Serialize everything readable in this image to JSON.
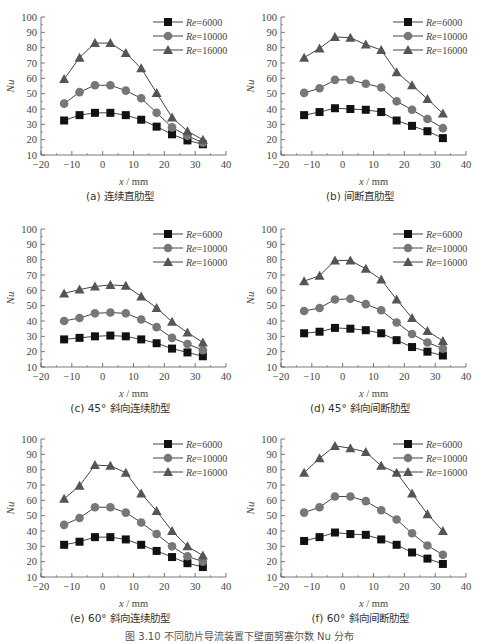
{
  "figure_caption": "图 3.10  不同肋片导流装置下壁面努塞尔数 Nu 分布",
  "chart_data": [
    {
      "type": "line",
      "caption": "(a) 连续直肋型",
      "xlabel": "x / mm",
      "ylabel": "Nu",
      "xlim": [
        -20,
        40
      ],
      "ylim": [
        10,
        100
      ],
      "xticks": [
        -20,
        -10,
        0,
        10,
        20,
        30,
        40
      ],
      "yticks": [
        10,
        20,
        30,
        40,
        50,
        60,
        70,
        80,
        90,
        100
      ],
      "grid": false,
      "legend_position": "upper right",
      "x": [
        -12.5,
        -7.5,
        -2.5,
        2.5,
        7.5,
        12.5,
        17.5,
        22.5,
        27.5,
        32.5
      ],
      "series": [
        {
          "name": "Re=6000",
          "marker": "square",
          "values": [
            32.5,
            36,
            37.5,
            37.5,
            36,
            33,
            28.5,
            23.5,
            19.5,
            17
          ]
        },
        {
          "name": "Re=10000",
          "marker": "circle",
          "values": [
            43.5,
            51,
            55.5,
            55.5,
            52,
            47,
            37.5,
            28,
            22.5,
            18
          ]
        },
        {
          "name": "Re=16000",
          "marker": "triangle",
          "values": [
            59.5,
            73.5,
            83,
            83,
            76.5,
            66.5,
            50.5,
            34.5,
            25.5,
            20
          ]
        }
      ]
    },
    {
      "type": "line",
      "caption": "(b) 间断直肋型",
      "xlabel": "x / mm",
      "ylabel": "Nu",
      "xlim": [
        -20,
        40
      ],
      "ylim": [
        10,
        100
      ],
      "xticks": [
        -20,
        -10,
        0,
        10,
        20,
        30,
        40
      ],
      "yticks": [
        10,
        20,
        30,
        40,
        50,
        60,
        70,
        80,
        90,
        100
      ],
      "grid": false,
      "legend_position": "upper right",
      "x": [
        -12.5,
        -7.5,
        -2.5,
        2.5,
        7.5,
        12.5,
        17.5,
        22.5,
        27.5,
        32.5
      ],
      "series": [
        {
          "name": "Re=6000",
          "marker": "square",
          "values": [
            36,
            38,
            40.5,
            40,
            39.5,
            38,
            32.5,
            29,
            25.5,
            21
          ]
        },
        {
          "name": "Re=10000",
          "marker": "circle",
          "values": [
            50.5,
            53.5,
            59,
            59,
            56.5,
            54,
            45,
            39.5,
            33.5,
            27.5
          ]
        },
        {
          "name": "Re=16000",
          "marker": "triangle",
          "values": [
            73.5,
            79.5,
            87,
            86.5,
            82,
            78.5,
            64,
            55.5,
            46.5,
            37
          ]
        }
      ]
    },
    {
      "type": "line",
      "caption": "(c) 45° 斜向连续肋型",
      "xlabel": "x / mm",
      "ylabel": "Nu",
      "xlim": [
        -20,
        40
      ],
      "ylim": [
        10,
        100
      ],
      "xticks": [
        -20,
        -10,
        0,
        10,
        20,
        30,
        40
      ],
      "yticks": [
        10,
        20,
        30,
        40,
        50,
        60,
        70,
        80,
        90,
        100
      ],
      "grid": false,
      "legend_position": "upper right",
      "x": [
        -12.5,
        -7.5,
        -2.5,
        2.5,
        7.5,
        12.5,
        17.5,
        22.5,
        27.5,
        32.5
      ],
      "series": [
        {
          "name": "Re=6000",
          "marker": "square",
          "values": [
            28,
            29,
            30,
            30.5,
            30,
            28,
            25.5,
            22,
            19.5,
            17
          ]
        },
        {
          "name": "Re=10000",
          "marker": "circle",
          "values": [
            40,
            42,
            45,
            45.5,
            45,
            41,
            36,
            29,
            25,
            21
          ]
        },
        {
          "name": "Re=16000",
          "marker": "triangle",
          "values": [
            58,
            60.5,
            62.5,
            63.5,
            63,
            56,
            48.5,
            39.5,
            32.5,
            26
          ]
        }
      ]
    },
    {
      "type": "line",
      "caption": "(d) 45° 斜向间断肋型",
      "xlabel": "x / mm",
      "ylabel": "Nu",
      "xlim": [
        -20,
        40
      ],
      "ylim": [
        10,
        100
      ],
      "xticks": [
        -20,
        -10,
        0,
        10,
        20,
        30,
        40
      ],
      "yticks": [
        10,
        20,
        30,
        40,
        50,
        60,
        70,
        80,
        90,
        100
      ],
      "grid": false,
      "legend_position": "upper right",
      "x": [
        -12.5,
        -7.5,
        -2.5,
        2.5,
        7.5,
        12.5,
        17.5,
        22.5,
        27.5,
        32.5
      ],
      "series": [
        {
          "name": "Re=6000",
          "marker": "square",
          "values": [
            32,
            33,
            35.5,
            35,
            34,
            32,
            27.5,
            23,
            20,
            17.5
          ]
        },
        {
          "name": "Re=10000",
          "marker": "circle",
          "values": [
            46.5,
            48.5,
            54,
            54.5,
            51,
            47,
            39,
            31.5,
            26,
            22
          ]
        },
        {
          "name": "Re=16000",
          "marker": "triangle",
          "values": [
            66,
            69.5,
            79.5,
            79.5,
            74,
            67,
            54,
            42,
            33.5,
            27
          ]
        }
      ]
    },
    {
      "type": "line",
      "caption": "(e) 60° 斜向连续肋型",
      "xlabel": "x / mm",
      "ylabel": "Nu",
      "xlim": [
        -20,
        40
      ],
      "ylim": [
        10,
        100
      ],
      "xticks": [
        -20,
        -10,
        0,
        10,
        20,
        30,
        40
      ],
      "yticks": [
        10,
        20,
        30,
        40,
        50,
        60,
        70,
        80,
        90,
        100
      ],
      "grid": false,
      "legend_position": "upper right",
      "x": [
        -12.5,
        -7.5,
        -2.5,
        2.5,
        7.5,
        12.5,
        17.5,
        22.5,
        27.5,
        32.5
      ],
      "series": [
        {
          "name": "Re=6000",
          "marker": "square",
          "values": [
            31,
            33,
            36,
            36,
            34.5,
            31,
            27,
            23,
            19,
            16.5
          ]
        },
        {
          "name": "Re=10000",
          "marker": "circle",
          "values": [
            44,
            48.5,
            55.5,
            55.5,
            52,
            45.5,
            38,
            30,
            23.5,
            20
          ]
        },
        {
          "name": "Re=16000",
          "marker": "triangle",
          "values": [
            61,
            69.5,
            83,
            82.5,
            78,
            64.5,
            53,
            40,
            30,
            24
          ]
        }
      ]
    },
    {
      "type": "line",
      "caption": "(f) 60° 斜向间断肋型",
      "xlabel": "x / mm",
      "ylabel": "Nu",
      "xlim": [
        -20,
        40
      ],
      "ylim": [
        10,
        100
      ],
      "xticks": [
        -20,
        -10,
        0,
        10,
        20,
        30,
        40
      ],
      "yticks": [
        10,
        20,
        30,
        40,
        50,
        60,
        70,
        80,
        90,
        100
      ],
      "grid": false,
      "legend_position": "upper right",
      "x": [
        -12.5,
        -7.5,
        -2.5,
        2.5,
        7.5,
        12.5,
        17.5,
        22.5,
        27.5,
        32.5
      ],
      "series": [
        {
          "name": "Re=6000",
          "marker": "square",
          "values": [
            33.5,
            36,
            39,
            38,
            37.5,
            34.5,
            31,
            26,
            22,
            18.5
          ]
        },
        {
          "name": "Re=10000",
          "marker": "circle",
          "values": [
            52,
            55.5,
            62.5,
            62.5,
            59.5,
            53.5,
            47.5,
            38.5,
            30.5,
            24.5
          ]
        },
        {
          "name": "Re=16000",
          "marker": "triangle",
          "values": [
            78,
            87.5,
            95.5,
            94,
            91.5,
            82.5,
            78,
            64.5,
            51,
            40
          ]
        }
      ]
    }
  ],
  "style": {
    "axis_color": "#555555",
    "series_colors": [
      "#111111",
      "#777777",
      "#555555"
    ],
    "line_color": "#444444"
  }
}
